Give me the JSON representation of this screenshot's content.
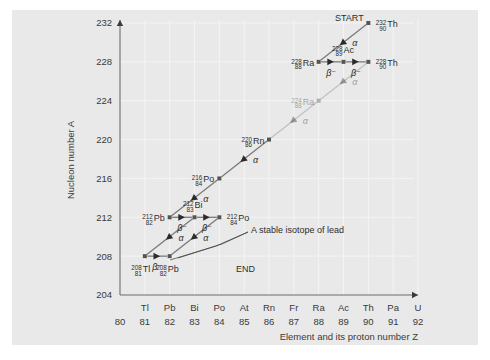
{
  "figure": {
    "background": "#e9e9e9",
    "axis_color": "#6d6d6d",
    "grid_color": "#f4f4f4",
    "chain_color": "#7a7a7a",
    "text_color": "#2e2e2e"
  },
  "axes": {
    "ylabel": "Nucleon number A",
    "xlabel": "Element and its proton number Z",
    "yticks": [
      232,
      228,
      224,
      220,
      216,
      212,
      208,
      204
    ],
    "ylim": [
      204,
      232
    ],
    "xlim": [
      80,
      92
    ],
    "xticks": [
      {
        "symbol": "",
        "z": "80"
      },
      {
        "symbol": "Tl",
        "z": "81"
      },
      {
        "symbol": "Pb",
        "z": "82"
      },
      {
        "symbol": "Bi",
        "z": "83"
      },
      {
        "symbol": "Po",
        "z": "84"
      },
      {
        "symbol": "At",
        "z": "85"
      },
      {
        "symbol": "Rn",
        "z": "86"
      },
      {
        "symbol": "Fr",
        "z": "87"
      },
      {
        "symbol": "Ra",
        "z": "88"
      },
      {
        "symbol": "Ac",
        "z": "89"
      },
      {
        "symbol": "Th",
        "z": "90"
      },
      {
        "symbol": "Pa",
        "z": "91"
      },
      {
        "symbol": "U",
        "z": "92"
      }
    ]
  },
  "annotations": {
    "start": "START",
    "end": "END",
    "stable_note": "A stable isotope of lead"
  },
  "chart_data": {
    "type": "scatter",
    "xlabel": "Element and its proton number Z",
    "ylabel": "Nucleon number A",
    "xlim": [
      80,
      92
    ],
    "ylim": [
      204,
      232
    ],
    "grid": true,
    "legend": "none",
    "nuclides": [
      {
        "id": "th232",
        "A": "232",
        "Z": "90",
        "element": "Th",
        "x": 90,
        "y": 232,
        "label_side": "right",
        "faint": false
      },
      {
        "id": "ra228",
        "A": "228",
        "Z": "88",
        "element": "Ra",
        "x": 88,
        "y": 228,
        "label_side": "left",
        "faint": false
      },
      {
        "id": "ac228",
        "A": "228",
        "Z": "89",
        "element": "Ac",
        "x": 89,
        "y": 228,
        "label_side": "above",
        "faint": false
      },
      {
        "id": "th228",
        "A": "228",
        "Z": "90",
        "element": "Th",
        "x": 90,
        "y": 228,
        "label_side": "right",
        "faint": false
      },
      {
        "id": "ra224",
        "A": "224",
        "Z": "88",
        "element": "Ra",
        "x": 88,
        "y": 224,
        "label_side": "left",
        "faint": true
      },
      {
        "id": "rn220",
        "A": "220",
        "Z": "86",
        "element": "Rn",
        "x": 86,
        "y": 220,
        "label_side": "left",
        "faint": false
      },
      {
        "id": "po216",
        "A": "216",
        "Z": "84",
        "element": "Po",
        "x": 84,
        "y": 216,
        "label_side": "left",
        "faint": false
      },
      {
        "id": "pb212",
        "A": "212",
        "Z": "82",
        "element": "Pb",
        "x": 82,
        "y": 212,
        "label_side": "left",
        "faint": false
      },
      {
        "id": "bi212",
        "A": "212",
        "Z": "83",
        "element": "Bi",
        "x": 83,
        "y": 212,
        "label_side": "above",
        "faint": false
      },
      {
        "id": "po212",
        "A": "212",
        "Z": "84",
        "element": "Po",
        "x": 84,
        "y": 212,
        "label_side": "right",
        "faint": false
      },
      {
        "id": "tl208",
        "A": "208",
        "Z": "81",
        "element": "Tl",
        "x": 81,
        "y": 208,
        "label_side": "below",
        "faint": false
      },
      {
        "id": "pb208",
        "A": "208",
        "Z": "82",
        "element": "Pb",
        "x": 82,
        "y": 208,
        "label_side": "below",
        "faint": false
      }
    ],
    "decays": [
      {
        "from": "th232",
        "to": "ra228",
        "type": "alpha",
        "symbol": "α"
      },
      {
        "from": "ra228",
        "to": "ac228",
        "type": "beta",
        "symbol": "β⁻"
      },
      {
        "from": "ac228",
        "to": "th228",
        "type": "beta",
        "symbol": "β⁻"
      },
      {
        "from": "th228",
        "to": "ra224",
        "type": "alpha",
        "symbol": "α"
      },
      {
        "from": "ra224",
        "to": "rn220",
        "type": "alpha",
        "symbol": "α"
      },
      {
        "from": "rn220",
        "to": "po216",
        "type": "alpha",
        "symbol": "α"
      },
      {
        "from": "po216",
        "to": "pb212",
        "type": "alpha",
        "symbol": "α"
      },
      {
        "from": "pb212",
        "to": "bi212",
        "type": "beta",
        "symbol": "β⁻"
      },
      {
        "from": "bi212",
        "to": "po212",
        "type": "beta",
        "symbol": "β⁻"
      },
      {
        "from": "bi212",
        "to": "tl208",
        "type": "alpha",
        "symbol": "α"
      },
      {
        "from": "po212",
        "to": "pb208",
        "type": "alpha",
        "symbol": "α"
      },
      {
        "from": "tl208",
        "to": "pb208",
        "type": "beta",
        "symbol": "β⁻"
      }
    ]
  }
}
